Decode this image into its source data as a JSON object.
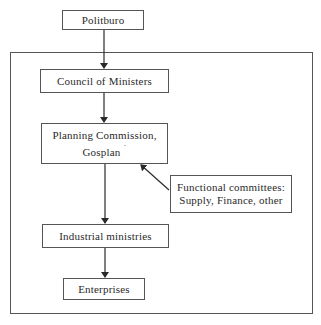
{
  "diagram": {
    "type": "organizational-flowchart",
    "nodes": [
      {
        "id": "politburo",
        "label": "Politburo"
      },
      {
        "id": "council",
        "label": "Council of Ministers"
      },
      {
        "id": "planning",
        "label_line1": "Planning Commission,",
        "label_line2": "Gosplan",
        "marker": "˙"
      },
      {
        "id": "functional",
        "label_line1": "Functional committees:",
        "label_line2": "Supply, Finance, other"
      },
      {
        "id": "industrial",
        "label": "Industrial ministries"
      },
      {
        "id": "enterprises",
        "label": "Enterprises"
      }
    ],
    "edges": [
      {
        "from": "politburo",
        "to": "council"
      },
      {
        "from": "council",
        "to": "planning"
      },
      {
        "from": "functional",
        "to": "planning"
      },
      {
        "from": "planning",
        "to": "industrial"
      },
      {
        "from": "industrial",
        "to": "enterprises"
      }
    ],
    "colors": {
      "line": "#2a2a2a",
      "border": "#555555",
      "background": "#ffffff"
    }
  }
}
